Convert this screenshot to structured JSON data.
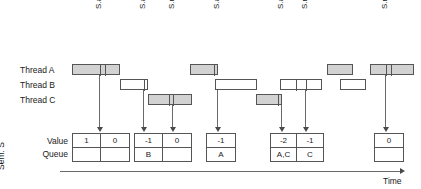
{
  "diagram": {
    "colors": {
      "bar_fill": "#d2d2d2",
      "bar_empty": "#ffffff",
      "stroke": "#555555",
      "arrow": "#4a4a4a",
      "text": "#1a1a1a",
      "background": "#ffffff"
    },
    "operations": [
      {
        "label": "S.acquire();",
        "x": 99
      },
      {
        "label": "S.acquire();",
        "x": 143
      },
      {
        "label": "S.release();",
        "x": 172
      },
      {
        "label": "S.acquire();",
        "x": 217
      },
      {
        "label": "S.acquire();",
        "x": 281
      },
      {
        "label": "S.release();",
        "x": 305
      },
      {
        "label": "S.release();",
        "x": 385
      }
    ],
    "threads": [
      {
        "label": "Thread A",
        "y": 64,
        "bars": [
          {
            "x": 72,
            "w": 48,
            "style": "filled",
            "ticks": [
              99,
              104
            ]
          },
          {
            "x": 190,
            "w": 28,
            "style": "filled",
            "ticks": [
              213
            ]
          },
          {
            "x": 327,
            "w": 26,
            "style": "filled",
            "ticks": []
          },
          {
            "x": 370,
            "w": 44,
            "style": "filled",
            "ticks": [
              385,
              390
            ]
          }
        ]
      },
      {
        "label": "Thread B",
        "y": 79,
        "bars": [
          {
            "x": 120,
            "w": 28,
            "style": "empty",
            "ticks": [
              143
            ]
          },
          {
            "x": 215,
            "w": 42,
            "style": "empty",
            "ticks": []
          },
          {
            "x": 280,
            "w": 42,
            "style": "empty",
            "ticks": [
              295,
              305
            ]
          },
          {
            "x": 340,
            "w": 26,
            "style": "empty",
            "ticks": []
          }
        ]
      },
      {
        "label": "Thread C",
        "y": 94,
        "bars": [
          {
            "x": 148,
            "w": 44,
            "style": "filled",
            "ticks": [
              168,
              172
            ]
          },
          {
            "x": 256,
            "w": 26,
            "style": "filled",
            "ticks": [
              277
            ]
          }
        ]
      }
    ],
    "semaphore": {
      "name": "Sem. S",
      "row_labels": {
        "value": "Value",
        "queue": "Queue"
      },
      "groups": [
        {
          "x": 72,
          "cells": [
            {
              "value": "1",
              "queue": "",
              "w": 28
            },
            {
              "value": "0",
              "queue": "",
              "w": 28
            }
          ]
        },
        {
          "x": 134,
          "cells": [
            {
              "value": "-1",
              "queue": "B",
              "w": 28
            },
            {
              "value": "0",
              "queue": "",
              "w": 28
            }
          ]
        },
        {
          "x": 206,
          "cells": [
            {
              "value": "-1",
              "queue": "A",
              "w": 28
            }
          ]
        },
        {
          "x": 270,
          "cells": [
            {
              "value": "-2",
              "queue": "A,C",
              "w": 26
            },
            {
              "value": "-1",
              "queue": "C",
              "w": 26
            }
          ]
        },
        {
          "x": 374,
          "cells": [
            {
              "value": "0",
              "queue": "",
              "w": 28
            }
          ]
        }
      ]
    },
    "time_axis": {
      "label": "Time"
    }
  }
}
